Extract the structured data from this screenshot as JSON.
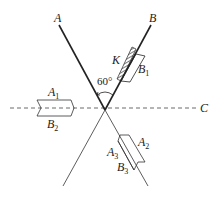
{
  "diagram": {
    "type": "physics-optics-geometry",
    "angle_label": "60°",
    "lines": {
      "A": {
        "label": "A"
      },
      "B": {
        "label": "B"
      },
      "C": {
        "label": "C",
        "style": "dashed"
      }
    },
    "blocks": {
      "K": {
        "label": "K",
        "style": "hatched"
      },
      "B1": {
        "base": "B",
        "sub": "1"
      },
      "A1": {
        "base": "A",
        "sub": "1"
      },
      "B2": {
        "base": "B",
        "sub": "2"
      },
      "A2": {
        "base": "A",
        "sub": "2"
      },
      "A3": {
        "base": "A",
        "sub": "3"
      },
      "B3": {
        "base": "B",
        "sub": "3"
      }
    },
    "colors": {
      "line": "#222222",
      "background": "#ffffff"
    }
  }
}
